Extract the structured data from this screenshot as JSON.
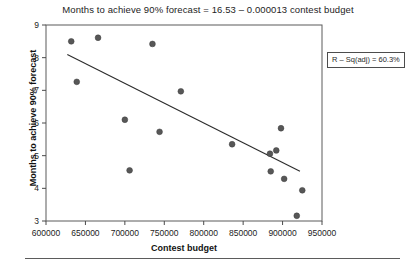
{
  "chart_data": {
    "type": "scatter",
    "title": "Months to achieve 90% forecast = 16.53 – 0.000013 contest budget",
    "xlabel": "Contest budget",
    "ylabel": "Months to achieve 90% forecast",
    "xlim": [
      600000,
      950000
    ],
    "ylim": [
      3,
      9
    ],
    "xticks": [
      600000,
      650000,
      700000,
      750000,
      800000,
      850000,
      900000,
      950000
    ],
    "xtick_labels": [
      "600000",
      "650000",
      "700000",
      "750000",
      "800000",
      "850000",
      "900000",
      "950000"
    ],
    "yticks": [
      3,
      4,
      5,
      6,
      7,
      8,
      9
    ],
    "ytick_labels": [
      "3",
      "4",
      "5",
      "6",
      "7",
      "8",
      "9"
    ],
    "grid": false,
    "legend": "none",
    "points": [
      {
        "x": 632000,
        "y": 8.5
      },
      {
        "x": 666000,
        "y": 8.61
      },
      {
        "x": 639000,
        "y": 7.26
      },
      {
        "x": 735000,
        "y": 8.42
      },
      {
        "x": 700000,
        "y": 6.1
      },
      {
        "x": 706000,
        "y": 4.55
      },
      {
        "x": 744000,
        "y": 5.73
      },
      {
        "x": 771000,
        "y": 6.97
      },
      {
        "x": 836000,
        "y": 5.35
      },
      {
        "x": 884000,
        "y": 5.06
      },
      {
        "x": 892000,
        "y": 5.16
      },
      {
        "x": 885000,
        "y": 4.52
      },
      {
        "x": 898000,
        "y": 5.84
      },
      {
        "x": 902000,
        "y": 4.29
      },
      {
        "x": 918000,
        "y": 3.16
      },
      {
        "x": 925000,
        "y": 3.94
      }
    ],
    "fit_line": {
      "intercept": 16.53,
      "slope": -1.3e-05,
      "x_start": 627000,
      "x_end": 922000,
      "y_start": 8.1,
      "y_end": 4.52
    },
    "annotation": {
      "rsq_adj_label": "R – Sq(adj) = 60.3%"
    }
  }
}
